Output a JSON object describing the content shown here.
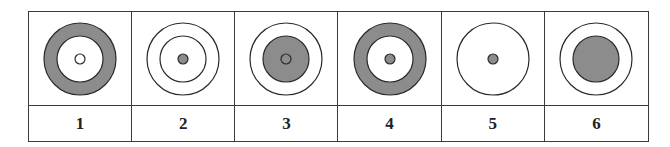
{
  "colors": {
    "fill": "#8c8c8c",
    "stroke": "#2a2a2a",
    "paper": "#ffffff"
  },
  "figures": [
    {
      "label": "1",
      "outer": {
        "r": 36,
        "fill": "#8c8c8c"
      },
      "middle": {
        "r": 23,
        "fill": "#ffffff"
      },
      "center": {
        "r": 5,
        "fill": "#ffffff"
      }
    },
    {
      "label": "2",
      "outer": {
        "r": 36,
        "fill": "#ffffff"
      },
      "middle": {
        "r": 23,
        "fill": "#ffffff"
      },
      "center": {
        "r": 5,
        "fill": "#8c8c8c"
      }
    },
    {
      "label": "3",
      "outer": {
        "r": 36,
        "fill": "#ffffff"
      },
      "middle": {
        "r": 23,
        "fill": "#8c8c8c"
      },
      "center": {
        "r": 5,
        "fill": "#8c8c8c"
      }
    },
    {
      "label": "4",
      "outer": {
        "r": 36,
        "fill": "#8c8c8c"
      },
      "middle": {
        "r": 23,
        "fill": "#ffffff"
      },
      "center": {
        "r": 5,
        "fill": "#8c8c8c"
      }
    },
    {
      "label": "5",
      "outer": {
        "r": 36,
        "fill": "#ffffff"
      },
      "middle": null,
      "center": {
        "r": 5,
        "fill": "#8c8c8c"
      }
    },
    {
      "label": "6",
      "outer": {
        "r": 36,
        "fill": "#ffffff"
      },
      "middle": {
        "r": 23,
        "fill": "#8c8c8c"
      },
      "center": null
    }
  ]
}
